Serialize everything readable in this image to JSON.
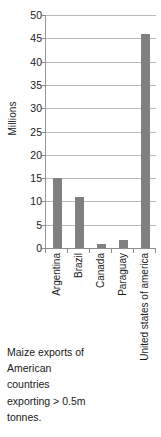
{
  "chart_data": {
    "type": "bar",
    "title": "",
    "xlabel": "",
    "ylabel": "Millions",
    "ylim": [
      0,
      50
    ],
    "ytick_step": 5,
    "grid": true,
    "legend": "none",
    "categories": [
      "Argentina",
      "Brazil",
      "Canada",
      "Paraguay",
      "United states of america"
    ],
    "values": [
      15,
      11,
      0.8,
      1.7,
      46
    ],
    "ytick_labels": [
      "50",
      "45",
      "40",
      "35",
      "30",
      "25",
      "20",
      "15",
      "10",
      "5",
      "0"
    ],
    "series": [
      {
        "name": "Maize exports",
        "values": [
          15,
          11,
          0.8,
          1.7,
          46
        ]
      }
    ]
  },
  "colors": {
    "bar": "#808080",
    "gridline": "#b9b9b9",
    "axis": "#8c8c8c",
    "text": "#1a1a1a",
    "background": "#ffffff"
  },
  "caption": {
    "lines": [
      "Maize exports of",
      "American",
      "countries",
      "exporting > 0.5m",
      "tonnes."
    ]
  }
}
